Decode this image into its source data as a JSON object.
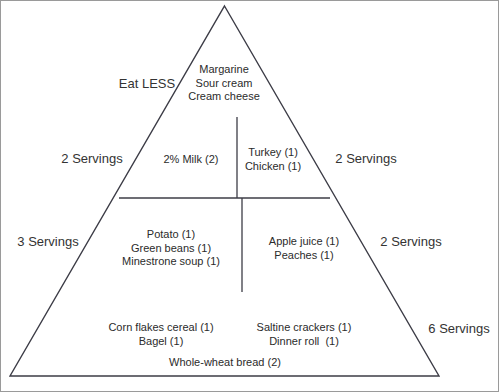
{
  "diagram": {
    "type": "food-pyramid"
  },
  "colors": {
    "outline": "#3c3c46",
    "border": "#9a9a9a",
    "divider_fats": "#5fd45f",
    "divider_fats_left": "#4a4a4a",
    "divider_grains": "#9c6a6a",
    "divider_plain": "#3c3c46",
    "text": "#2b2b2b",
    "background": "#ffffff"
  },
  "tiers": {
    "fats": {
      "side_label": "Eat LESS",
      "items": [
        "Margarine",
        "Sour cream",
        "Cream cheese"
      ],
      "text": "Margarine\nSour cream\nCream cheese"
    },
    "dairy": {
      "side_label": "2 Servings",
      "items": [
        "2% Milk (2)"
      ],
      "text": "2% Milk (2)"
    },
    "protein": {
      "side_label": "2 Servings",
      "items": [
        "Turkey (1)",
        "Chicken (1)"
      ],
      "text": "Turkey (1)\nChicken (1)"
    },
    "vegetables": {
      "side_label": "3 Servings",
      "items": [
        "Potato (1)",
        "Green beans (1)",
        "Minestrone soup (1)"
      ],
      "text": "Potato (1)\nGreen beans (1)\nMinestrone soup (1)"
    },
    "fruits": {
      "side_label": "2 Servings",
      "items": [
        "Apple juice (1)",
        "Peaches (1)"
      ],
      "text": "Apple juice (1)\nPeaches (1)"
    },
    "grains": {
      "side_label": "6 Servings",
      "items_left": [
        "Corn flakes cereal (1)",
        "Bagel (1)"
      ],
      "items_right": [
        "Saltine crackers (1)",
        "Dinner roll  (1)"
      ],
      "items_bottom": [
        "Whole-wheat bread (2)"
      ],
      "text_left": "Corn flakes cereal (1)\nBagel (1)",
      "text_right": "Saltine crackers (1)\nDinner roll  (1)",
      "text_bottom": "Whole-wheat bread (2)"
    }
  }
}
